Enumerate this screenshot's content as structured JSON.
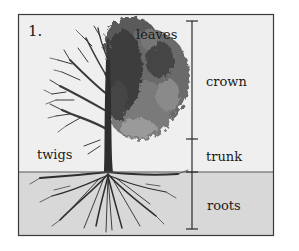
{
  "figure": {
    "number": "1.",
    "labels": {
      "leaves": "leaves",
      "twigs": "twigs",
      "crown": "crown",
      "trunk": "trunk",
      "roots": "roots"
    }
  },
  "colors": {
    "sky": "#efefef",
    "soil": "#d8d8d8",
    "frame": "#3a3a3a",
    "line": "#2a2a2a",
    "foliage_dark": "#3c3c3c",
    "foliage_mid": "#6e6e6e",
    "foliage_light": "#9a9a9a"
  }
}
